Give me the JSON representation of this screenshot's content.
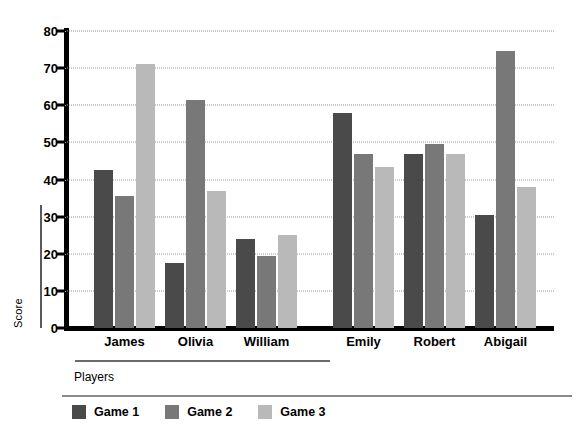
{
  "chart_data": {
    "type": "bar",
    "title": "",
    "subtitle": "",
    "xlabel": "Players",
    "ylabel": "Score",
    "categories": [
      "James",
      "Olivia",
      "William",
      "Emily",
      "Robert",
      "Abigail"
    ],
    "series": [
      {
        "name": "Game 1",
        "color": "#4a4a4a",
        "values": [
          42.5,
          17.5,
          24.0,
          58.0,
          47.0,
          30.5
        ]
      },
      {
        "name": "Game 2",
        "color": "#787878",
        "values": [
          35.5,
          61.5,
          19.5,
          47.0,
          49.5,
          74.5
        ]
      },
      {
        "name": "Game 3",
        "color": "#b9b9b9",
        "values": [
          71.0,
          37.0,
          25.0,
          43.5,
          47.0,
          38.0
        ]
      }
    ],
    "ylim": [
      0,
      80
    ],
    "yticks": [
      0,
      10,
      20,
      30,
      40,
      50,
      60,
      70,
      80
    ],
    "ytick_labels": [
      "0",
      "10",
      "20",
      "30",
      "40",
      "50",
      "60",
      "70",
      "80"
    ],
    "grid": true,
    "grid_style": "dotted",
    "grid_axis": "y",
    "legend_position": "bottom-left",
    "legend_entries": [
      "Game 1",
      "Game 2",
      "Game 3"
    ],
    "group_gap_after_index": 2,
    "axis_color": "#000000",
    "background_color": "#ffffff"
  }
}
